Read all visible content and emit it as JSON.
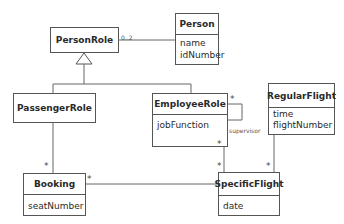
{
  "diagram": {
    "type": "UML class diagram",
    "classes": {
      "person_role": {
        "name": "PersonRole",
        "attributes": []
      },
      "person": {
        "name": "Person",
        "attributes": [
          "name",
          "idNumber"
        ]
      },
      "passenger_role": {
        "name": "PassengerRole",
        "attributes": []
      },
      "employee_role": {
        "name": "EmployeeRole",
        "attributes": [
          "jobFunction"
        ]
      },
      "regular_flight": {
        "name": "RegularFlight",
        "attributes": [
          "time",
          "flightNumber"
        ]
      },
      "booking": {
        "name": "Booking",
        "attributes": [
          "seatNumber"
        ]
      },
      "specific_flight": {
        "name": "SpecificFlight",
        "attributes": [
          "date"
        ]
      }
    },
    "associations": [
      {
        "from": "PersonRole",
        "to": "Person",
        "multiplicity_near_from": "0..2"
      },
      {
        "from": "PassengerRole",
        "to": "Booking",
        "multiplicity_near_to": "*"
      },
      {
        "from": "Booking",
        "to": "SpecificFlight",
        "multiplicity_near_from": "*"
      },
      {
        "from": "EmployeeRole",
        "to": "SpecificFlight",
        "multiplicity_near_from": "*",
        "multiplicity_near_to": "*"
      },
      {
        "from": "RegularFlight",
        "to": "SpecificFlight",
        "multiplicity_near_to": "*"
      },
      {
        "from": "EmployeeRole",
        "to": "EmployeeRole",
        "role": "supervisor",
        "multiplicity": "*"
      }
    ],
    "generalizations": [
      {
        "parent": "PersonRole",
        "children": [
          "PassengerRole",
          "EmployeeRole"
        ]
      }
    ],
    "labels": {
      "person_role_person_mult": "0..2",
      "passenger_booking_mult": "*",
      "booking_specific_mult": "*",
      "employee_specific_mult_top": "*",
      "employee_specific_mult_bottom": "*",
      "regular_specific_mult": "*",
      "self_loop_mult": "*",
      "self_loop_role": "supervisor"
    }
  }
}
